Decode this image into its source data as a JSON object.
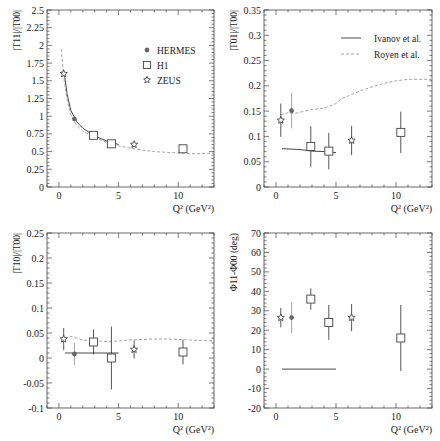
{
  "figure": {
    "legend_markers": [
      {
        "label": "HERMES",
        "marker": "filled-circle",
        "color": "#888888"
      },
      {
        "label": "H1",
        "marker": "open-square",
        "color": "#333333"
      },
      {
        "label": "ZEUS",
        "marker": "open-star",
        "color": "#333333"
      }
    ],
    "legend_lines": [
      {
        "label": "Ivanov et al.",
        "style": "solid",
        "color": "#333333"
      },
      {
        "label": "Royen et al.",
        "style": "dashed",
        "color": "#999999"
      }
    ],
    "xlabel": "Q² (GeV²)"
  },
  "chart_data": [
    {
      "id": "t11",
      "type": "scatter",
      "title": "",
      "ylabel": "|T11|/|T00|",
      "xlabel": "Q² (GeV²)",
      "xlim": [
        -1,
        13
      ],
      "ylim": [
        0,
        2.5
      ],
      "xticks": [
        0,
        5,
        10
      ],
      "yticks": [
        0,
        0.25,
        0.5,
        0.75,
        1,
        1.25,
        1.5,
        1.75,
        2,
        2.25,
        2.5
      ],
      "ytick_labels": [
        "0",
        "0.25",
        "0.5",
        "0.75",
        "1",
        "1.25",
        "1.5",
        "1.75",
        "2",
        "2.25",
        "2.5"
      ],
      "grid": false,
      "legend": "markers",
      "legend_position": "upper right",
      "series": [
        {
          "name": "HERMES",
          "marker": "filled-circle",
          "points": [
            {
              "x": 1.3,
              "y": 0.96,
              "err": 0.02
            }
          ]
        },
        {
          "name": "H1",
          "marker": "open-square",
          "points": [
            {
              "x": 2.9,
              "y": 0.73,
              "err": 0.02
            },
            {
              "x": 4.4,
              "y": 0.61,
              "err": 0.02
            },
            {
              "x": 10.4,
              "y": 0.54,
              "err": 0.02
            }
          ]
        },
        {
          "name": "ZEUS",
          "marker": "open-star",
          "points": [
            {
              "x": 0.4,
              "y": 1.6,
              "err": 0.03
            },
            {
              "x": 6.3,
              "y": 0.6,
              "err": 0.02
            }
          ]
        },
        {
          "name": "Ivanov et al.",
          "line": "solid",
          "x": [
            0.45,
            0.7,
            1.0,
            1.5,
            2.0,
            3.0,
            4.0,
            5.0
          ],
          "y": [
            1.6,
            1.3,
            1.08,
            0.92,
            0.83,
            0.72,
            0.65,
            0.6
          ]
        },
        {
          "name": "Royen et al.",
          "line": "dashed",
          "x": [
            0.2,
            0.4,
            0.7,
            1.0,
            1.5,
            2.0,
            3.0,
            4.0,
            5.0,
            6.0,
            7.0,
            8.0,
            9.0,
            10.0,
            11.0,
            12.0,
            13.0
          ],
          "y": [
            1.95,
            1.55,
            1.22,
            1.02,
            0.87,
            0.79,
            0.7,
            0.63,
            0.58,
            0.55,
            0.52,
            0.5,
            0.49,
            0.48,
            0.47,
            0.47,
            0.48
          ]
        }
      ]
    },
    {
      "id": "t01",
      "type": "scatter",
      "title": "",
      "ylabel": "|T01|/|T00|",
      "xlabel": "Q² (GeV²)",
      "xlim": [
        -1,
        13
      ],
      "ylim": [
        0,
        0.35
      ],
      "xticks": [
        0,
        5,
        10
      ],
      "yticks": [
        0,
        0.05,
        0.1,
        0.15,
        0.2,
        0.25,
        0.3,
        0.35
      ],
      "ytick_labels": [
        "0",
        "0.05",
        "0.1",
        "0.15",
        "0.2",
        "0.25",
        "0.3",
        "0.35"
      ],
      "grid": false,
      "legend": "lines",
      "legend_position": "upper right",
      "series": [
        {
          "name": "HERMES",
          "marker": "filled-circle",
          "points": [
            {
              "x": 1.3,
              "y": 0.151,
              "err": 0.035
            }
          ]
        },
        {
          "name": "H1",
          "marker": "open-square",
          "points": [
            {
              "x": 2.9,
              "y": 0.08,
              "err": 0.04
            },
            {
              "x": 4.4,
              "y": 0.071,
              "err": 0.036
            },
            {
              "x": 10.4,
              "y": 0.108,
              "err": 0.041
            }
          ]
        },
        {
          "name": "ZEUS",
          "marker": "open-star",
          "points": [
            {
              "x": 0.4,
              "y": 0.132,
              "err": 0.033
            },
            {
              "x": 6.3,
              "y": 0.092,
              "err": 0.029
            }
          ]
        },
        {
          "name": "Ivanov et al.",
          "line": "solid",
          "x": [
            0.5,
            2.0,
            3.0,
            4.0,
            5.0
          ],
          "y": [
            0.076,
            0.074,
            0.071,
            0.07,
            0.068
          ]
        },
        {
          "name": "Royen et al.",
          "line": "dashed",
          "x": [
            0.4,
            1.0,
            1.5,
            2.0,
            3.0,
            4.0,
            5.0,
            5.5,
            6.0,
            7.0,
            8.0,
            9.0,
            10.0,
            11.0,
            12.0,
            13.0
          ],
          "y": [
            0.143,
            0.147,
            0.145,
            0.148,
            0.153,
            0.156,
            0.165,
            0.175,
            0.18,
            0.19,
            0.198,
            0.205,
            0.21,
            0.213,
            0.213,
            0.213
          ]
        }
      ]
    },
    {
      "id": "t10",
      "type": "scatter",
      "title": "",
      "ylabel": "|T10|/|T00|",
      "xlabel": "Q² (GeV²)",
      "xlim": [
        -1,
        13
      ],
      "ylim": [
        -0.1,
        0.25
      ],
      "xticks": [
        0,
        5,
        10
      ],
      "yticks": [
        -0.1,
        -0.05,
        0,
        0.05,
        0.1,
        0.15,
        0.2,
        0.25
      ],
      "ytick_labels": [
        "-0.1",
        "-0.05",
        "0",
        "0.05",
        "0.1",
        "0.15",
        "0.2",
        "0.25"
      ],
      "grid": false,
      "legend": "none",
      "series": [
        {
          "name": "HERMES",
          "marker": "filled-circle",
          "points": [
            {
              "x": 1.3,
              "y": 0.008,
              "err": 0.022
            }
          ]
        },
        {
          "name": "H1",
          "marker": "open-square",
          "points": [
            {
              "x": 2.9,
              "y": 0.032,
              "err": 0.025
            },
            {
              "x": 4.4,
              "y": 0.0,
              "err": 0.063
            },
            {
              "x": 10.4,
              "y": 0.012,
              "err": 0.025
            }
          ]
        },
        {
          "name": "ZEUS",
          "marker": "open-star",
          "points": [
            {
              "x": 0.4,
              "y": 0.038,
              "err": 0.022
            },
            {
              "x": 6.3,
              "y": 0.017,
              "err": 0.018
            }
          ]
        },
        {
          "name": "Ivanov et al.",
          "line": "solid",
          "x": [
            0.5,
            5.0
          ],
          "y": [
            0.01,
            0.01
          ]
        },
        {
          "name": "Royen et al.",
          "line": "dashed",
          "x": [
            0.2,
            0.6,
            1.0,
            1.5,
            2.0,
            3.0,
            4.0,
            5.0,
            6.0,
            7.0,
            8.0,
            9.0,
            10.0,
            11.0,
            12.0,
            13.0
          ],
          "y": [
            0.032,
            0.04,
            0.043,
            0.04,
            0.036,
            0.034,
            0.033,
            0.034,
            0.036,
            0.037,
            0.038,
            0.038,
            0.037,
            0.036,
            0.035,
            0.034
          ]
        }
      ]
    },
    {
      "id": "phase",
      "type": "scatter",
      "title": "",
      "ylabel": "Φ11-Φ00 (deg)",
      "xlabel": "Q² (GeV²)",
      "xlim": [
        -1,
        13
      ],
      "ylim": [
        -20,
        70
      ],
      "xticks": [
        0,
        5,
        10
      ],
      "yticks": [
        -20,
        -10,
        0,
        10,
        20,
        30,
        40,
        50,
        60,
        70
      ],
      "ytick_labels": [
        "-20",
        "-10",
        "0",
        "10",
        "20",
        "30",
        "40",
        "50",
        "60",
        "70"
      ],
      "grid": false,
      "legend": "none",
      "series": [
        {
          "name": "HERMES",
          "marker": "filled-circle",
          "points": [
            {
              "x": 1.3,
              "y": 26.5,
              "err": 8
            }
          ]
        },
        {
          "name": "H1",
          "marker": "open-square",
          "points": [
            {
              "x": 2.9,
              "y": 36,
              "err": 5.5
            },
            {
              "x": 4.4,
              "y": 24,
              "err": 9
            },
            {
              "x": 10.4,
              "y": 16,
              "err": 17
            }
          ]
        },
        {
          "name": "ZEUS",
          "marker": "open-star",
          "points": [
            {
              "x": 0.4,
              "y": 26.5,
              "err": 5
            },
            {
              "x": 6.3,
              "y": 26.5,
              "err": 7
            }
          ]
        },
        {
          "name": "Ivanov et al.",
          "line": "solid",
          "x": [
            0.5,
            5.0
          ],
          "y": [
            0,
            0
          ]
        }
      ]
    }
  ]
}
